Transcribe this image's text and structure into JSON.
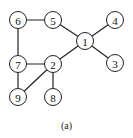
{
  "diagram": {
    "type": "graph",
    "caption": "(a)",
    "nodes": [
      {
        "id": "1",
        "label": "1",
        "x": 85,
        "y": 41
      },
      {
        "id": "2",
        "label": "2",
        "x": 53,
        "y": 64
      },
      {
        "id": "3",
        "label": "3",
        "x": 115,
        "y": 63
      },
      {
        "id": "4",
        "label": "4",
        "x": 115,
        "y": 20
      },
      {
        "id": "5",
        "label": "5",
        "x": 53,
        "y": 20
      },
      {
        "id": "6",
        "label": "6",
        "x": 18,
        "y": 20
      },
      {
        "id": "7",
        "label": "7",
        "x": 18,
        "y": 64
      },
      {
        "id": "8",
        "label": "8",
        "x": 53,
        "y": 97
      },
      {
        "id": "9",
        "label": "9",
        "x": 18,
        "y": 97
      }
    ],
    "edges": [
      [
        "6",
        "5"
      ],
      [
        "6",
        "7"
      ],
      [
        "5",
        "1"
      ],
      [
        "1",
        "4"
      ],
      [
        "1",
        "3"
      ],
      [
        "1",
        "2"
      ],
      [
        "7",
        "2"
      ],
      [
        "7",
        "9"
      ],
      [
        "2",
        "9"
      ],
      [
        "2",
        "8"
      ]
    ]
  }
}
